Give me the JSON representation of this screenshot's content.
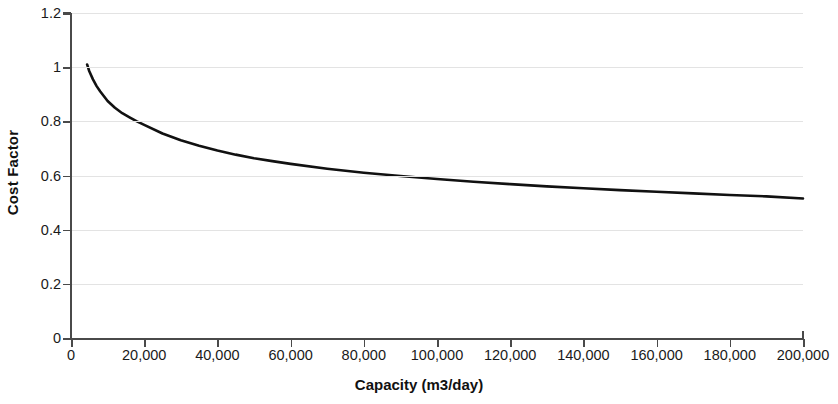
{
  "chart_data": {
    "type": "line",
    "title": "",
    "xlabel": "Capacity (m3/day)",
    "ylabel": "Cost Factor",
    "xlim": [
      0,
      200000
    ],
    "ylim": [
      0,
      1.2
    ],
    "grid": true,
    "legend": "none",
    "line_color": "#111111",
    "x_tick_labels": [
      "0",
      "20,000",
      "40,000",
      "60,000",
      "80,000",
      "100,000",
      "120,000",
      "140,000",
      "160,000",
      "180,000",
      "200,000"
    ],
    "x_tick_values": [
      0,
      20000,
      40000,
      60000,
      80000,
      100000,
      120000,
      140000,
      160000,
      180000,
      200000
    ],
    "y_tick_labels": [
      "0",
      "0.2",
      "0.4",
      "0.6",
      "0.8",
      "1",
      "1.2"
    ],
    "y_tick_values": [
      0,
      0.2,
      0.4,
      0.6,
      0.8,
      1,
      1.2
    ],
    "series": [
      {
        "name": "Cost Factor",
        "x": [
          4400,
          5000,
          6000,
          7000,
          8000,
          10000,
          12000,
          14000,
          16000,
          18000,
          20000,
          25000,
          30000,
          35000,
          40000,
          45000,
          50000,
          55000,
          60000,
          70000,
          80000,
          90000,
          100000,
          110000,
          120000,
          130000,
          140000,
          150000,
          160000,
          170000,
          180000,
          190000,
          200000
        ],
        "y": [
          1.01,
          0.985,
          0.955,
          0.93,
          0.91,
          0.875,
          0.85,
          0.83,
          0.815,
          0.8,
          0.787,
          0.755,
          0.73,
          0.71,
          0.692,
          0.677,
          0.664,
          0.653,
          0.643,
          0.625,
          0.61,
          0.598,
          0.587,
          0.577,
          0.568,
          0.56,
          0.553,
          0.546,
          0.54,
          0.534,
          0.528,
          0.523,
          0.515
        ]
      }
    ]
  }
}
